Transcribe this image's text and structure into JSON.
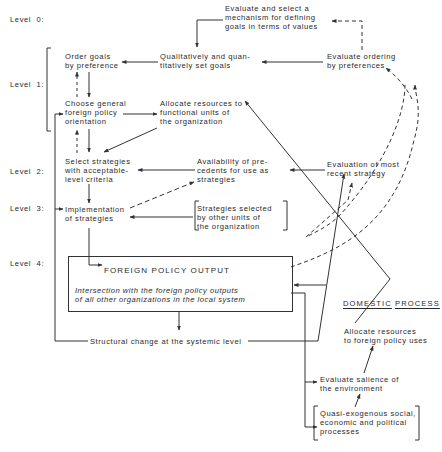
{
  "levels": {
    "level0": "Level  0:",
    "level1": "Level  1:",
    "level2": "Level  2:",
    "level3": "Level  3:",
    "level4": "Level  4:"
  },
  "nodes": {
    "evaluate_select_mechanism": "Evaluate and select a\nmechanism for defining\ngoals in terms of values",
    "qual_quant_set_goals": "Qualitatively and quan-\ntitatively set goals",
    "evaluate_ordering": "Evaluate ordering\nby preferences",
    "order_goals": "Order goals\nby preference",
    "choose_orientation": "Choose general\nforeign policy\norientation",
    "allocate_functional": "Allocate resources to\nfunctional units of\nthe organization",
    "select_strategies": "Select strategies\nwith acceptable-\nlevel criteria",
    "availability_precedents": "Availability of pre-\ncedents for use as\nstrategies",
    "evaluation_recent": "Evaluation of most\nrecent strategy",
    "implementation": "Implementation\nof strategies",
    "strategies_other_units": "Strategies selected\nby other units of\nthe organization",
    "foreign_policy_output": "FOREIGN POLICY OUTPUT",
    "intersection": "Intersection with the foreign policy outputs\nof all other organizations in the local system",
    "structural_change": "Structural change at the systemic level",
    "domestic_process_word1": "DOMESTIC",
    "domestic_process_word2": "PROCESS",
    "allocate_foreign_uses": "Allocate resources\nto foreign policy uses",
    "evaluate_salience": "Evaluate salience of\nthe environment",
    "quasi_exogenous": "Quasi-exogenous social,\neconomic and political\nprocesses"
  },
  "colors": {
    "line": "#333333",
    "text": "#2a2a2a",
    "background": "#ffffff"
  }
}
